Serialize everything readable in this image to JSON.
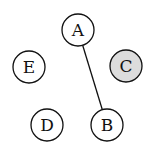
{
  "diagram": {
    "type": "graph",
    "nodes": [
      {
        "id": "A",
        "label": "A",
        "cx": 78,
        "cy": 30,
        "r": 16,
        "fill": "#ffffff"
      },
      {
        "id": "B",
        "label": "B",
        "cx": 107,
        "cy": 125,
        "r": 16,
        "fill": "#ffffff"
      },
      {
        "id": "C",
        "label": "C",
        "cx": 126,
        "cy": 66,
        "r": 16,
        "fill": "#dcdcdc"
      },
      {
        "id": "D",
        "label": "D",
        "cx": 47,
        "cy": 125,
        "r": 16,
        "fill": "#ffffff"
      },
      {
        "id": "E",
        "label": "E",
        "cx": 29,
        "cy": 67,
        "r": 16,
        "fill": "#ffffff"
      }
    ],
    "edges": [
      {
        "from": "A",
        "to": "B"
      }
    ],
    "highlight_color": "#dcdcdc",
    "stroke_color": "#111111"
  }
}
